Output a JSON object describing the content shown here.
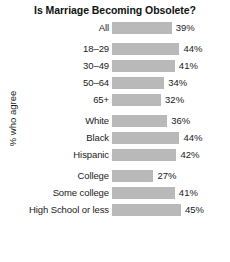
{
  "chart_data": {
    "type": "bar",
    "orientation": "horizontal",
    "title": "Is Marriage Becoming Obsolete?",
    "xlabel": "",
    "ylabel": "% who agree",
    "xlim": [
      0,
      60
    ],
    "grid": false,
    "legend": null,
    "value_suffix": "%",
    "bar_color": "#b9b9b9",
    "categories": [
      "All",
      "18–29",
      "30–49",
      "50–64",
      "65+",
      "White",
      "Black",
      "Hispanic",
      "College",
      "Some college",
      "High School or less"
    ],
    "values": [
      39,
      44,
      41,
      34,
      32,
      36,
      44,
      42,
      27,
      41,
      45
    ],
    "groups": [
      {
        "name": "overall",
        "rows": [
          {
            "label": "All",
            "value": 39,
            "value_text": "39%"
          }
        ]
      },
      {
        "name": "age",
        "rows": [
          {
            "label": "18–29",
            "value": 44,
            "value_text": "44%"
          },
          {
            "label": "30–49",
            "value": 41,
            "value_text": "41%"
          },
          {
            "label": "50–64",
            "value": 34,
            "value_text": "34%"
          },
          {
            "label": "65+",
            "value": 32,
            "value_text": "32%"
          }
        ]
      },
      {
        "name": "race-ethnicity",
        "rows": [
          {
            "label": "White",
            "value": 36,
            "value_text": "36%"
          },
          {
            "label": "Black",
            "value": 44,
            "value_text": "44%"
          },
          {
            "label": "Hispanic",
            "value": 42,
            "value_text": "42%"
          }
        ]
      },
      {
        "name": "education",
        "rows": [
          {
            "label": "College",
            "value": 27,
            "value_text": "27%"
          },
          {
            "label": "Some college",
            "value": 41,
            "value_text": "41%"
          },
          {
            "label": "High School or less",
            "value": 45,
            "value_text": "45%"
          }
        ]
      }
    ]
  }
}
